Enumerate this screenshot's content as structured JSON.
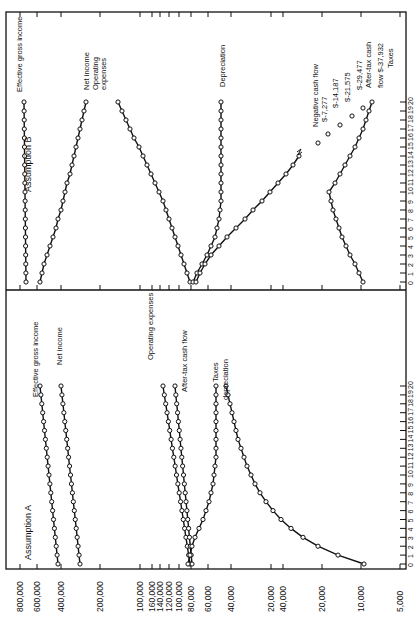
{
  "chart_data": [
    {
      "type": "line",
      "title": "Assumption A",
      "xlabel": "Year",
      "ylabel": "Dollars (broken scale)",
      "x": [
        0,
        1,
        2,
        3,
        4,
        5,
        6,
        7,
        8,
        9,
        10,
        11,
        12,
        13,
        14,
        15,
        16,
        17,
        18,
        19,
        20
      ],
      "x_tick_labels": [
        "0",
        "1",
        "2",
        "3",
        "4",
        "5",
        "6",
        "7",
        "8",
        "9",
        "10",
        "11",
        "12",
        "13",
        "14",
        "15",
        "16",
        "17",
        "18",
        "19",
        "20"
      ],
      "y_tick_labels": [
        "800,000",
        "600,000",
        "400,000",
        "200,000",
        "100,000",
        "160,000",
        "140,000",
        "120,000",
        "100,000",
        "80,000",
        "60,000",
        "40,000",
        "20,000",
        "40,000",
        "20,000",
        "10,000",
        "5,000"
      ],
      "grid": false,
      "series": [
        {
          "name": "Effective gross income",
          "values": [
            350000,
            360000,
            372000,
            384000,
            396000,
            408000,
            420000,
            433000,
            446000,
            459000,
            473000,
            487000,
            502000,
            517000,
            532000,
            548000,
            565000,
            582000,
            599000,
            617000,
            635000
          ]
        },
        {
          "name": "Net income",
          "values": [
            262000,
            270000,
            278000,
            286000,
            295000,
            304000,
            313000,
            322000,
            332000,
            342000,
            352000,
            363000,
            374000,
            385000,
            396000,
            408000,
            420000,
            433000,
            446000,
            459000,
            473000
          ]
        },
        {
          "name": "Operating expenses",
          "values": [
            78000,
            80000,
            82500,
            85000,
            87500,
            90000,
            93000,
            96000,
            99000,
            102000,
            105000,
            108000,
            111000,
            115000,
            118000,
            122000,
            125000,
            129000,
            133000,
            137000,
            141000
          ]
        },
        {
          "name": "After-tax cash flow",
          "values": [
            76000,
            77000,
            78500,
            80000,
            82000,
            84000,
            86000,
            88000,
            90000,
            92500,
            95000,
            97500,
            100000,
            103000,
            106000,
            109000,
            112000,
            115000,
            118000,
            121000,
            125000
          ]
        },
        {
          "name": "Taxes",
          "values": [
            74000,
            72000,
            69000,
            66000,
            63000,
            60000,
            57500,
            55000,
            53500,
            52500,
            51500,
            51000,
            50500,
            50200,
            50000,
            49800,
            49600,
            49400,
            49200,
            49000,
            48800
          ]
        },
        {
          "name": "Depreciation",
          "values": [
            10000,
            12000,
            14000,
            16000,
            18000,
            20000,
            22000,
            24000,
            26000,
            28000,
            30000,
            32000,
            33500,
            35000,
            36500,
            38000,
            39500,
            41000,
            42500,
            44000,
            45500
          ]
        }
      ]
    },
    {
      "type": "line",
      "title": "Assumption B",
      "xlabel": "Year",
      "ylabel": "Dollars (broken scale)",
      "x": [
        0,
        1,
        2,
        3,
        4,
        5,
        6,
        7,
        8,
        9,
        10,
        11,
        12,
        13,
        14,
        15,
        16,
        17,
        18,
        19,
        20
      ],
      "x_tick_labels": [
        "0",
        "1",
        "2",
        "3",
        "4",
        "5",
        "6",
        "7",
        "8",
        "9",
        "10",
        "11",
        "12",
        "13",
        "14",
        "15",
        "16",
        "17",
        "18",
        "19",
        "20"
      ],
      "grid": false,
      "series": [
        {
          "name": "Effective gross income",
          "values": [
            350000,
            350000,
            350000,
            350000,
            350000,
            350000,
            350000,
            350000,
            350000,
            350000,
            350000,
            350000,
            350000,
            350000,
            350000,
            350000,
            350000,
            350000,
            350000,
            350000,
            350000
          ]
        },
        {
          "name": "Net income",
          "values": [
            262000,
            255000,
            247000,
            239000,
            231000,
            222000,
            213000,
            204000,
            195000,
            186000,
            177000,
            168000,
            158000,
            149000,
            139000,
            130000,
            121000,
            113000,
            106000,
            100000,
            96000
          ]
        },
        {
          "name": "Operating expenses",
          "values": [
            78000,
            80000,
            82000,
            84000,
            86000,
            88500,
            91000,
            93500,
            96000,
            99000,
            102000,
            105000,
            108000,
            111000,
            114000,
            117000,
            120000,
            124000,
            128000,
            132000,
            136000
          ]
        },
        {
          "name": "Depreciation",
          "values": [
            74000,
            70000,
            66000,
            62000,
            59000,
            56000,
            54000,
            52500,
            51500,
            51000,
            50700,
            50500,
            50300,
            50200,
            50100,
            50000,
            50000,
            50000,
            50000,
            50000,
            50000
          ]
        },
        {
          "name": "After-tax cash flow",
          "values": [
            76000,
            73000,
            69000,
            64000,
            58000,
            52000,
            46000,
            40000,
            34000,
            28000,
            23000,
            19000,
            16000,
            14000,
            12500
          ]
        },
        {
          "name": "Negative cash flow",
          "values_by_year": {
            "16": -7277,
            "17": -14187,
            "18": -21575,
            "19": -29477,
            "20": -37932
          }
        },
        {
          "name": "Taxes",
          "values": [
            10000,
            11000,
            12000,
            13000,
            14000,
            15000,
            16000,
            17000,
            18000,
            19000,
            20000,
            17000,
            14000,
            12000,
            10500,
            9200,
            8000,
            7000,
            6200,
            5600,
            5000
          ]
        }
      ],
      "annotations": [
        "Negative cash flow",
        "$-7,277",
        "$-14,187",
        "$-21,575",
        "$-29,477",
        "After-tax cash flow $-37,932",
        "Taxes"
      ]
    }
  ],
  "labels": {
    "panel_a_title": "Assumption A",
    "panel_b_title": "Assumption B",
    "a_egi": "Effective gross income",
    "a_net": "Net income",
    "a_opex": "Operating expenses",
    "a_atcf": "After-tax cash flow",
    "a_taxes": "Taxes",
    "a_dep": "depreciation",
    "b_egi": "Effective gross income",
    "b_net": "Net income",
    "b_opex1": "Operating",
    "b_opex2": "expenses",
    "b_dep": "Depreciation",
    "b_neg": "Negative cash flow",
    "b_n1": "$-7,277",
    "b_n2": "$-14,187",
    "b_n3": "$-21,575",
    "b_n4": "$-29,477",
    "b_atcf1": "After-tax cash",
    "b_atcf2": "flow $-37,932",
    "b_taxes": "Taxes"
  },
  "axis": {
    "value_ticks": [
      {
        "label": "800,000",
        "x": 20
      },
      {
        "label": "600,000",
        "x": 37
      },
      {
        "label": "400,000",
        "x": 61
      },
      {
        "label": "200,000",
        "x": 100
      },
      {
        "label": "100,000",
        "x": 140
      },
      {
        "label": "160,000",
        "x": 152
      },
      {
        "label": "140,000",
        "x": 160
      },
      {
        "label": "120,000",
        "x": 169
      },
      {
        "label": "100,000",
        "x": 179
      },
      {
        "label": "80,000",
        "x": 191
      },
      {
        "label": "60,000",
        "x": 208
      },
      {
        "label": "40,000",
        "x": 231
      },
      {
        "label": "20,000",
        "x": 271
      },
      {
        "label": "40,000",
        "x": 283
      },
      {
        "label": "20,000",
        "x": 322
      },
      {
        "label": "10,000",
        "x": 361
      },
      {
        "label": "5,000",
        "x": 400
      }
    ],
    "year_labels": [
      "0",
      "1",
      "2",
      "3",
      "4",
      "5",
      "6",
      "7",
      "8",
      "9",
      "10",
      "11",
      "12",
      "13",
      "14",
      "15",
      "16",
      "17",
      "18",
      "19",
      "20"
    ]
  }
}
